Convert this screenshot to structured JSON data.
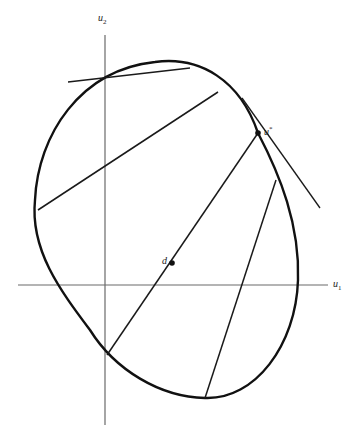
{
  "diagram": {
    "type": "geometry",
    "axes": {
      "horizontal": {
        "label": "u",
        "subscript": "1"
      },
      "vertical": {
        "label": "u",
        "subscript": "2"
      }
    },
    "points": {
      "d": {
        "label": "d"
      },
      "u_star": {
        "label": "u",
        "superscript": "*"
      }
    },
    "colors": {
      "curve": "#111111",
      "axis": "#6a6a6a",
      "background": "#ffffff"
    }
  }
}
